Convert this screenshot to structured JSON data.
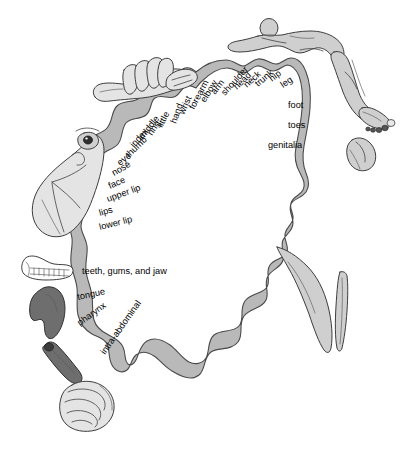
{
  "figure": {
    "background_color": "#ffffff",
    "band_color": "#b9b9b9",
    "band_outline_color": "#4a4a4a",
    "text_color": "#000000"
  },
  "labels": {
    "cortex_strip": [
      {
        "id": "hand",
        "text": "hand",
        "x": 176,
        "y": 124,
        "rotate": -70
      },
      {
        "id": "wrist",
        "text": "wrist",
        "x": 184,
        "y": 115,
        "rotate": -66
      },
      {
        "id": "forearm",
        "text": "forearm",
        "x": 194,
        "y": 110,
        "rotate": -62
      },
      {
        "id": "elbow",
        "text": "elbow",
        "x": 205,
        "y": 103,
        "rotate": -58
      },
      {
        "id": "arm",
        "text": "arm",
        "x": 215,
        "y": 95,
        "rotate": -52
      },
      {
        "id": "shoulder",
        "text": "shoulder",
        "x": 225,
        "y": 96,
        "rotate": -48
      },
      {
        "id": "head",
        "text": "head",
        "x": 237,
        "y": 90,
        "rotate": -44
      },
      {
        "id": "neck",
        "text": "neck",
        "x": 247,
        "y": 88,
        "rotate": -42
      },
      {
        "id": "trunk",
        "text": "trunk",
        "x": 258,
        "y": 87,
        "rotate": -40
      },
      {
        "id": "hip",
        "text": "hip",
        "x": 272,
        "y": 82,
        "rotate": -38
      },
      {
        "id": "leg",
        "text": "leg",
        "x": 283,
        "y": 88,
        "rotate": -34
      },
      {
        "id": "foot",
        "text": "foot",
        "x": 288,
        "y": 108,
        "rotate": 0
      },
      {
        "id": "toes",
        "text": "toes",
        "x": 288,
        "y": 128,
        "rotate": 0
      },
      {
        "id": "genitalia",
        "text": "genitalia",
        "x": 268,
        "y": 148,
        "rotate": 0
      },
      {
        "id": "little",
        "text": "little",
        "x": 162,
        "y": 128,
        "rotate": -62
      },
      {
        "id": "ring",
        "text": "ring",
        "x": 152,
        "y": 136,
        "rotate": -56
      },
      {
        "id": "middle",
        "text": "middle",
        "x": 143,
        "y": 140,
        "rotate": -52
      },
      {
        "id": "index",
        "text": "index",
        "x": 134,
        "y": 148,
        "rotate": -48
      },
      {
        "id": "thumb",
        "text": "thumb",
        "x": 129,
        "y": 158,
        "rotate": -44
      },
      {
        "id": "eye",
        "text": "eye",
        "x": 120,
        "y": 166,
        "rotate": -38
      },
      {
        "id": "nose",
        "text": "nose",
        "x": 114,
        "y": 176,
        "rotate": -30
      },
      {
        "id": "face",
        "text": "face",
        "x": 110,
        "y": 189,
        "rotate": -24
      },
      {
        "id": "upper-lip",
        "text": "upper lip",
        "x": 108,
        "y": 202,
        "rotate": -20
      },
      {
        "id": "lips",
        "text": "lips",
        "x": 100,
        "y": 216,
        "rotate": -16
      },
      {
        "id": "lower-lip",
        "text": "lower lip",
        "x": 100,
        "y": 230,
        "rotate": -14
      },
      {
        "id": "teeth-gums-jaw",
        "text": "teeth, gums, and jaw",
        "x": 82,
        "y": 274,
        "rotate": 0
      },
      {
        "id": "tongue",
        "text": "tongue",
        "x": 78,
        "y": 300,
        "rotate": -12
      },
      {
        "id": "pharynx",
        "text": "pharynx",
        "x": 80,
        "y": 326,
        "rotate": -36
      },
      {
        "id": "intra-abdominal",
        "text": "intra-abdominal",
        "x": 105,
        "y": 355,
        "rotate": -55
      }
    ]
  },
  "illustrations": [
    {
      "id": "hand-fingers-thumb",
      "name": "hand-illustration",
      "region": "top-left"
    },
    {
      "id": "face-eye-profile",
      "name": "face-illustration",
      "region": "left"
    },
    {
      "id": "jaw-teeth",
      "name": "jaw-teeth-illustration",
      "region": "left-lower"
    },
    {
      "id": "tongue-shape",
      "name": "tongue-illustration",
      "region": "left-lower"
    },
    {
      "id": "pharynx-tube",
      "name": "pharynx-illustration",
      "region": "left-lower"
    },
    {
      "id": "intestines-coil",
      "name": "intra-abdominal-illustration",
      "region": "bottom-left"
    },
    {
      "id": "reclining-body",
      "name": "body-trunk-illustration",
      "region": "top-right"
    },
    {
      "id": "leg-foot-toes",
      "name": "leg-foot-illustration",
      "region": "right"
    },
    {
      "id": "genitalia-shape",
      "name": "genitalia-illustration",
      "region": "right"
    }
  ]
}
